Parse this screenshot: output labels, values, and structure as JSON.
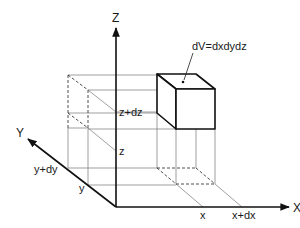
{
  "diagram": {
    "axes": {
      "x": {
        "label": "X"
      },
      "y": {
        "label": "Y"
      },
      "z": {
        "label": "Z"
      }
    },
    "annotations": {
      "volume": "dV=dxdydz",
      "x": "x",
      "x_dx": "x+dx",
      "y": "y",
      "y_dy": "y+dy",
      "z": "z",
      "z_dz": "z+dz"
    },
    "colors": {
      "axis": "#111111",
      "construction_lines": "#777777",
      "background": "#ffffff"
    }
  }
}
